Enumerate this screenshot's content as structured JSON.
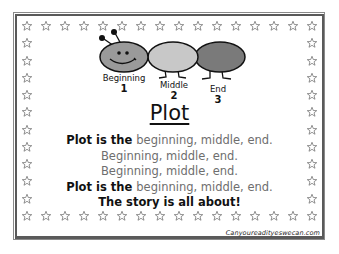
{
  "poster": {
    "title": "Plot",
    "caterpillar": {
      "segments": [
        {
          "label": "Beginning",
          "number": "1",
          "color": "#9a9a9a"
        },
        {
          "label": "Middle",
          "number": "2",
          "color": "#c8c8c8"
        },
        {
          "label": "End",
          "number": "3",
          "color": "#7a7a7a"
        }
      ]
    },
    "poem": [
      {
        "dark": "Plot is the ",
        "gray": "beginning, middle, end."
      },
      {
        "dark": "",
        "gray": "Beginning, middle, end."
      },
      {
        "dark": "",
        "gray": "Beginning, middle, end."
      },
      {
        "dark": "Plot is the ",
        "gray": "beginning, middle, end."
      },
      {
        "dark": "The story is all about!",
        "gray": ""
      }
    ],
    "website": "Canyoureadityeswecan.com"
  },
  "border": {
    "icon": "star-outline-icon",
    "top_count": 16,
    "bottom_count": 16,
    "side_count": 12,
    "star_color": "#777777",
    "frame_color": "#5a5a5a"
  }
}
